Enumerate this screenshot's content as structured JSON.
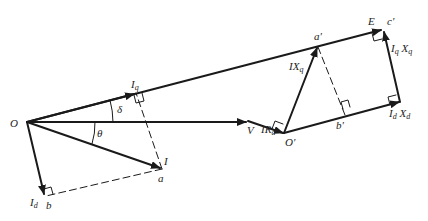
{
  "diagram": {
    "type": "phasor-diagram",
    "colors": {
      "line": "#1a1a1a",
      "background": "#ffffff"
    },
    "labels": {
      "O": "O",
      "V": "V",
      "E": "E",
      "I": "I",
      "Iq": "I",
      "Iq_sub": "q",
      "Id": "I",
      "Id_sub": "d",
      "a": "a",
      "b": "b",
      "a_prime": "a′",
      "b_prime": "b′",
      "c_prime": "c′",
      "O_prime": "O′",
      "delta": "δ",
      "theta": "θ",
      "IRa": "IR",
      "IRa_sub": "a",
      "IXq": "IX",
      "IXq_sub": "q",
      "IqXq": "I",
      "IqXq_sub1": "q",
      "IqXq_mid": " X",
      "IqXq_sub2": "q",
      "IdXd": "I",
      "IdXd_sub1": "d",
      "IdXd_mid": " X",
      "IdXd_sub2": "d"
    }
  }
}
